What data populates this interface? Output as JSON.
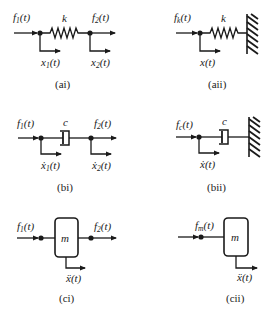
{
  "figure": {
    "panels": [
      {
        "id": "ai",
        "caption": "(ai)",
        "element": "spring",
        "element_label": "k",
        "input_force": {
          "base": "f",
          "sub": "1",
          "arg": "(t)"
        },
        "output_force": {
          "base": "f",
          "sub": "2",
          "arg": "(t)"
        },
        "disp1": {
          "base": "x",
          "sub": "1",
          "arg": "(t)"
        },
        "disp2": {
          "base": "x",
          "sub": "2",
          "arg": "(t)"
        }
      },
      {
        "id": "aii",
        "caption": "(aii)",
        "element": "spring-to-ground",
        "element_label": "k",
        "input_force": {
          "base": "f",
          "sub": "k",
          "arg": "(t)"
        },
        "disp1": {
          "base": "x",
          "sub": "",
          "arg": "(t)"
        }
      },
      {
        "id": "bi",
        "caption": "(bi)",
        "element": "damper",
        "element_label": "c",
        "input_force": {
          "base": "f",
          "sub": "1",
          "arg": "(t)"
        },
        "output_force": {
          "base": "f",
          "sub": "2",
          "arg": "(t)"
        },
        "disp1": {
          "base": "ẋ",
          "sub": "1",
          "arg": "(t)"
        },
        "disp2": {
          "base": "ẋ",
          "sub": "2",
          "arg": "(t)"
        }
      },
      {
        "id": "bii",
        "caption": "(bii)",
        "element": "damper-to-ground",
        "element_label": "c",
        "input_force": {
          "base": "f",
          "sub": "c",
          "arg": "(t)"
        },
        "disp1": {
          "base": "ẋ",
          "sub": "",
          "arg": "(t)"
        }
      },
      {
        "id": "ci",
        "caption": "(ci)",
        "element": "mass",
        "element_label": "m",
        "input_force": {
          "base": "f",
          "sub": "1",
          "arg": "(t)"
        },
        "output_force": {
          "base": "f",
          "sub": "2",
          "arg": "(t)"
        },
        "disp1": {
          "base": "ẍ",
          "sub": "",
          "arg": "(t)"
        }
      },
      {
        "id": "cii",
        "caption": "(cii)",
        "element": "mass-grounded",
        "element_label": "m",
        "input_force": {
          "base": "f",
          "sub": "m",
          "arg": "(t)"
        },
        "disp1": {
          "base": "ẍ",
          "sub": "",
          "arg": "(t)"
        }
      }
    ]
  }
}
